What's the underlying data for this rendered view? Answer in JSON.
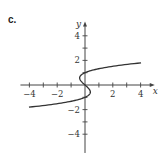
{
  "panel_label": "c.",
  "chart_data": {
    "type": "line",
    "title": "",
    "xlabel": "x",
    "ylabel": "y",
    "xlim": [
      -4.5,
      4.8
    ],
    "ylim": [
      -5.2,
      5
    ],
    "grid": false,
    "x_ticks": [
      -4,
      -3,
      -2,
      -1,
      1,
      2,
      3,
      4
    ],
    "x_tick_labels": [
      "-4",
      "-2",
      "2",
      "4"
    ],
    "y_ticks": [
      -4,
      -3,
      -2,
      -1,
      1,
      2,
      3,
      4
    ],
    "y_tick_labels": [
      "4",
      "2",
      "-2",
      "-4"
    ],
    "series": [
      {
        "name": "x = y^3 - y",
        "equation": "x = y^3 - y",
        "y_range": [
          -1.8,
          1.8
        ],
        "points": [
          {
            "x": -4.03,
            "y": -1.8
          },
          {
            "x": -1.5,
            "y": -1.4
          },
          {
            "x": 0,
            "y": -1
          },
          {
            "x": 0.385,
            "y": -0.577
          },
          {
            "x": 0,
            "y": 0
          },
          {
            "x": -0.385,
            "y": 0.577
          },
          {
            "x": 0,
            "y": 1
          },
          {
            "x": 1.5,
            "y": 1.4
          },
          {
            "x": 4.03,
            "y": 1.8
          }
        ]
      }
    ]
  }
}
